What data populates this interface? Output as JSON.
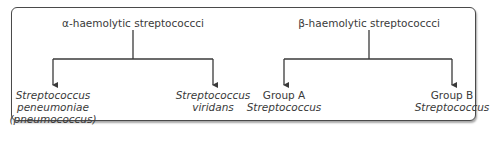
{
  "diagram": {
    "groups": [
      {
        "title": "α-haemolytic streptococcci",
        "children": [
          {
            "lines": [
              "Streptococcus",
              "peneumoniae",
              "(pneumococcus)"
            ],
            "italic": [
              true,
              true,
              true
            ]
          },
          {
            "lines": [
              "Streptococcus",
              "viridans"
            ],
            "italic": [
              true,
              true
            ]
          }
        ]
      },
      {
        "title": "β-haemolytic streptococcci",
        "children": [
          {
            "lines": [
              "Group A",
              "Streptococcus"
            ],
            "italic": [
              false,
              true
            ]
          },
          {
            "lines": [
              "Group B",
              "Streptococcus"
            ],
            "italic": [
              false,
              true
            ]
          }
        ]
      }
    ],
    "colors": {
      "line": "#3a3a3a",
      "border": "#4a4a4a",
      "text": "#3a3a3a"
    }
  }
}
